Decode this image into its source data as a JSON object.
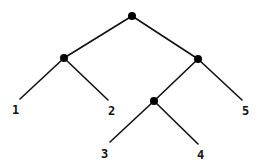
{
  "diagram": {
    "type": "binary-tree",
    "background": "#ffffff",
    "line_color": "#111111",
    "node_color": "#000000",
    "nodes": [
      {
        "id": "root",
        "x": 132,
        "y": 16
      },
      {
        "id": "n12",
        "x": 64,
        "y": 58
      },
      {
        "id": "n345",
        "x": 198,
        "y": 59
      },
      {
        "id": "n34",
        "x": 154,
        "y": 101
      }
    ],
    "leaves": [
      {
        "id": "leaf1",
        "label": "1",
        "end_x": 20,
        "end_y": 99,
        "label_x": 12,
        "label_y": 114
      },
      {
        "id": "leaf2",
        "label": "2",
        "end_x": 108,
        "end_y": 100,
        "label_x": 108,
        "label_y": 115
      },
      {
        "id": "leaf3",
        "label": "3",
        "end_x": 110,
        "end_y": 142,
        "label_x": 101,
        "label_y": 158
      },
      {
        "id": "leaf4",
        "label": "4",
        "end_x": 198,
        "end_y": 144,
        "label_x": 197,
        "label_y": 159
      },
      {
        "id": "leaf5",
        "label": "5",
        "end_x": 242,
        "end_y": 100,
        "label_x": 242,
        "label_y": 115
      }
    ],
    "edges": [
      {
        "from": "root",
        "to": "n12"
      },
      {
        "from": "root",
        "to": "n345"
      },
      {
        "from": "n12",
        "to": "leaf1"
      },
      {
        "from": "n12",
        "to": "leaf2"
      },
      {
        "from": "n345",
        "to": "n34"
      },
      {
        "from": "n345",
        "to": "leaf5"
      },
      {
        "from": "n34",
        "to": "leaf3"
      },
      {
        "from": "n34",
        "to": "leaf4"
      }
    ]
  }
}
